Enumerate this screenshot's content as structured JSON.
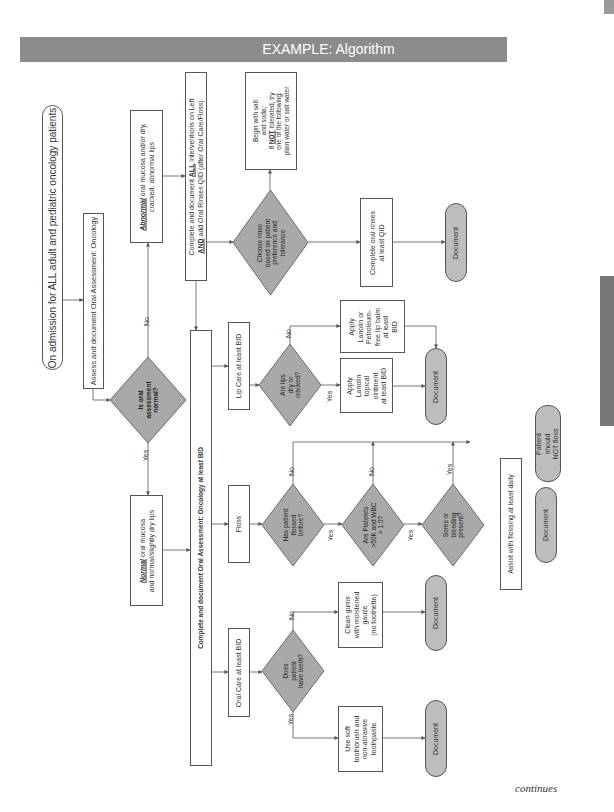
{
  "header": {
    "title": "EXAMPLE: Algorithm"
  },
  "footer": {
    "text": "continues"
  },
  "colors": {
    "header_bg": "#8c8c8c",
    "diamond_fill": "#a9a9a9",
    "pill_fill": "#bdbdbd",
    "line": "#555555"
  },
  "nodes": {
    "start": "On admission for ALL adult and pediatric oncology patients",
    "assess": "Assess and document Oral Assessment: Oncology",
    "decision_normal": {
      "line1": "Is oral",
      "line2": "assessment",
      "line3": "normal?"
    },
    "abnormal": {
      "emph": "Abnormal",
      "rest1": " oral mucosa and/or dry,",
      "rest2": "cracked, abnormal lips"
    },
    "normal": {
      "emph": "Normal",
      "rest1": " oral mucosa",
      "rest2": "and normal/slightly dry lips"
    },
    "complete_all": {
      "line1a": "Complete and document ",
      "line1b": "ALL",
      "line1c": " interventions on Left",
      "line2a": "AND",
      "line2b": " add Oral Rinses QID (after Oral Care/Floss)"
    },
    "complete_bid": "Complete and document Oral Assessment: Oncology at least BID",
    "oral_care": "Oral Care at least BID",
    "floss": "Floss",
    "lip_care": "Lip Care at least BID",
    "choose_rinse": {
      "line1": "Choose rinse",
      "line2": "based on patient",
      "line3": "preference and",
      "line4": "tolerance"
    },
    "begin_salt": {
      "line1": "Begin with salt",
      "line2": "and soda;",
      "line3a": "If ",
      "line3b": "NOT",
      "line3c": " tolerated, try",
      "line4": "one of the following:",
      "line5": "plain water or salt water"
    },
    "complete_rinses": {
      "line1": "Complete oral rinses",
      "line2": "at least QID"
    },
    "document_rinses": "Document",
    "lips_decision": {
      "line1": "Are lips",
      "line2": "dry or",
      "line3": "cracked?"
    },
    "lip_yes": {
      "line1": "Apply",
      "line2": "Lanolin",
      "line3": "topical",
      "line4": "ointment",
      "line5": "at least BID"
    },
    "lip_no": {
      "line1": "Apply",
      "line2": "Lanolin or",
      "line3": "Petroleum-",
      "line4": "free lip balm",
      "line5": "at least",
      "line6": "BID"
    },
    "document_lips": "Document",
    "flossed_decision": {
      "line1": "Has patient",
      "line2": "flossed",
      "line3": "before?"
    },
    "platelets_decision": {
      "line1": "Are Platelets",
      "line2": ">50K and WBC",
      "line3": "> 1.0?"
    },
    "sores_decision": {
      "line1": "Sores or",
      "line2": "bleeding",
      "line3": "present?"
    },
    "assist_floss": "Assist with flossing at least daily",
    "document_floss": "Document",
    "no_floss": {
      "line1": "Patient",
      "line2": "should",
      "line3": "NOT floss"
    },
    "teeth_decision": {
      "line1": "Does",
      "line2": "patient",
      "line3": "have teeth?"
    },
    "clean_gums": {
      "line1": "Clean gums",
      "line2": "with moistened",
      "line3": "gauze",
      "line4": "(no toothette)"
    },
    "soft_brush": {
      "line1": "Use soft",
      "line2": "toothbrush and",
      "line3": "non-abrasive",
      "line4": "toothpaste"
    },
    "document_gums": "Document",
    "document_brush": "Document"
  },
  "edge_labels": {
    "yes": "Yes",
    "no": "No"
  }
}
